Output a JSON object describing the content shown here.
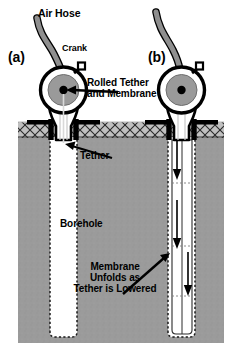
{
  "figure": {
    "type": "technical-diagram",
    "panels": [
      {
        "id": "a",
        "label": "(a)",
        "state": "membrane rolled on spool, tether not lowered"
      },
      {
        "id": "b",
        "label": "(b)",
        "state": "membrane unfolding as tether is lowered"
      }
    ],
    "labels": {
      "air_hose": "Air Hose",
      "crank": "Crank",
      "rolled_tether_membrane": "Rolled Tether\nand Membrane",
      "tether": "Tether",
      "borehole": "Borehole",
      "membrane_unfolds": "Membrane\nUnfolds as\nTether is Lowered"
    },
    "colors": {
      "background": "#ffffff",
      "soil_fill": "#9a9a9a",
      "soil_hatch_band": "#b4b4b4",
      "hose_fill": "#8f8f8f",
      "spool_inner": "#9a9a9a",
      "outline": "#000000",
      "borehole_fill": "#ffffff"
    },
    "annotations": [
      {
        "name": "arrow-rolled-tether",
        "points_to": "spool center",
        "direction": "right-to-left"
      },
      {
        "name": "arrow-tether",
        "points_to": "tether at borehole mouth",
        "direction": "right-to-left"
      },
      {
        "name": "arrow-membrane-unfolds",
        "points_to": "membrane in borehole (b)",
        "direction": "left-to-right-up"
      },
      {
        "name": "downward-flow-arrows",
        "count": 2,
        "panel": "b",
        "direction": "down"
      }
    ]
  }
}
